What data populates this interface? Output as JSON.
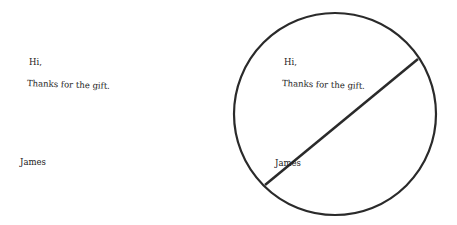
{
  "left_note": {
    "greeting": "Hi,",
    "body": "Thanks for the gift.",
    "signature": "James"
  },
  "right_note": {
    "greeting": "Hi,",
    "body": "Thanks for the gift.",
    "signature": "James"
  },
  "figure": {
    "shape": "circle-with-diagonal-line",
    "stroke_color": "#2a2a2a"
  }
}
